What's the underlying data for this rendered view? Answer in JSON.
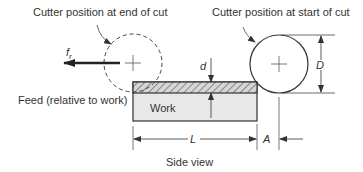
{
  "diagram": {
    "labels": {
      "end_position": "Cutter position at end of cut",
      "start_position": "Cutter position at start of cut",
      "feed": "Feed (relative to work)",
      "work": "Work",
      "caption": "Side view"
    },
    "symbols": {
      "feed_rate": "f",
      "feed_rate_sub": "r",
      "depth": "d",
      "diameter": "D",
      "length": "L",
      "approach": "A"
    },
    "colors": {
      "line": "#333333",
      "work_fill": "#e6e6e6",
      "hatch_fill": "#d0d0d0"
    }
  }
}
